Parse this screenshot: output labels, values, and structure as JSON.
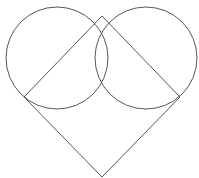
{
  "diagram": {
    "width": 199,
    "height": 178,
    "background": "#ffffff",
    "stroke_color": "#555555",
    "stroke_width": 1,
    "circles": [
      {
        "name": "left-circle",
        "cx": 57,
        "cy": 58,
        "r": 51
      },
      {
        "name": "right-circle",
        "cx": 146,
        "cy": 58,
        "r": 51
      }
    ],
    "square": {
      "name": "rotated-square",
      "points": [
        [
          102,
          16
        ],
        [
          180,
          97
        ],
        [
          102,
          177
        ],
        [
          24,
          97
        ]
      ]
    }
  }
}
